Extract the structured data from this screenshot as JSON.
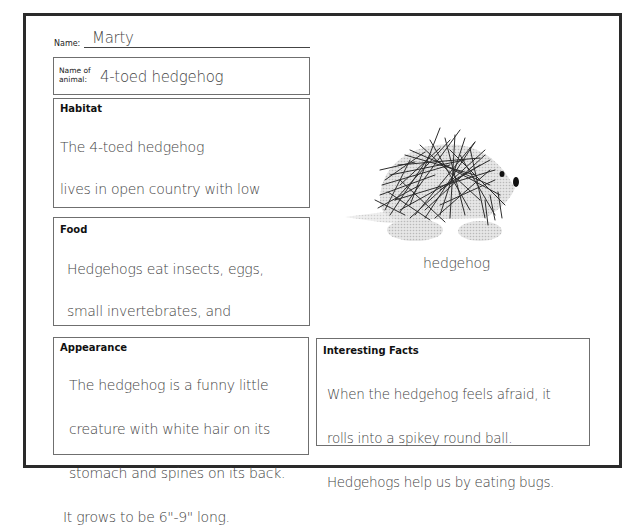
{
  "worksheet": {
    "name_label": "Name:",
    "name_value": "Marty",
    "animal_label_line1": "Name of",
    "animal_label_line2": "animal:",
    "animal_value": "4-toed hedgehog",
    "sections": {
      "habitat": {
        "title": "Habitat",
        "lines": [
          "The 4-toed hedgehog",
          "lives in open country with low",
          "vegetation in Central Africa."
        ]
      },
      "food": {
        "title": "Food",
        "lines": [
          "Hedgehogs eat insects, eggs,",
          "small invertebrates, and",
          "sometimes carrion."
        ]
      },
      "appearance": {
        "title": "Appearance",
        "lines": [
          "The hedgehog is a funny little",
          "creature with white hair on its",
          "stomach and spines on its back.",
          "It grows to be 6\"-9\" long."
        ]
      },
      "interesting_facts": {
        "title": "Interesting Facts",
        "lines": [
          "When the hedgehog feels afraid, it",
          "rolls into a spikey round ball.",
          "Hedgehogs help us by eating bugs."
        ]
      }
    },
    "illustration": {
      "icon": "hedgehog-illustration",
      "caption": "hedgehog"
    }
  }
}
